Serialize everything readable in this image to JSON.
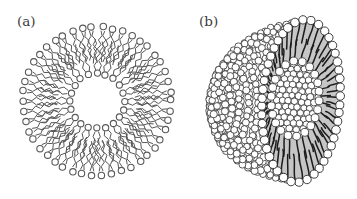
{
  "figure": {
    "background": "#ffffff",
    "panels": [
      {
        "label": "(a)",
        "kind": "lipid-bilayer-vesicle-cross-section",
        "label_pos": {
          "x": 17,
          "y": 26
        },
        "center": {
          "x": 97,
          "y": 101
        },
        "stroke": "#585858",
        "head_fill": "#ffffff",
        "outer_leaflet": {
          "count": 46,
          "ring_radius": 74,
          "head_radius": 3.2,
          "tail_from": 70,
          "tail_to": 40
        },
        "inner_leaflet": {
          "count": 20,
          "ring_radius": 27.5,
          "head_radius": 3.1,
          "tail_from": 31,
          "tail_to": 60
        },
        "tail_amplitude": 1.6,
        "tail_step": 4.6
      },
      {
        "label": "(b)",
        "kind": "liposome-3d-cutaway",
        "label_pos": {
          "x": 199,
          "y": 26
        },
        "cut_center": {
          "x": 301,
          "y": 101
        },
        "cut_rx": 38.5,
        "cut_ry": 81,
        "tilt": 4,
        "pole": {
          "x": 217,
          "y": 106
        },
        "cavity_center": {
          "x": 295,
          "y": 99
        },
        "cavity_rx": 24,
        "cavity_ry": 38,
        "ball_fill": "#ffffff",
        "ball_stroke": "#2e2e2e",
        "band_fill": "#c6c6c6",
        "band_edge": "#555555",
        "tail_color": "#1c1c1c",
        "surface_rings": [
          87,
          80,
          73,
          66,
          59,
          52,
          45,
          38,
          31,
          24,
          17,
          10
        ],
        "surface_ball_radius": 3.4,
        "surface_ball_spacing": 6.6,
        "rim_ball_count": 46,
        "rim_ball_radius": 4.2,
        "cavity_ring_count": 22,
        "cavity_ring_ball_radius": 3.9,
        "cavity_fill_ball_radius": 3.3,
        "outer_tail_count": 52,
        "inner_tail_count": 32
      }
    ]
  }
}
